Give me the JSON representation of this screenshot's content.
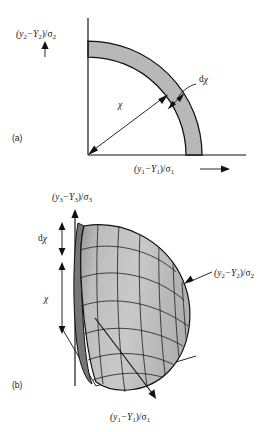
{
  "figure": {
    "background_color": "#ffffff",
    "ink_color": "#111111",
    "shade_color": "#b8b8b8",
    "shade_dark_color": "#8a8a8a",
    "shade_light_color": "#cfcfcf"
  },
  "panel_a": {
    "id": "(a)",
    "yaxis_label": {
      "base1": "(y",
      "sub1": "2",
      "mid": "−Y",
      "sub2": "2",
      "tail": ")/σ",
      "sub3": "2",
      "full": "(y2−Y2)/σ2"
    },
    "xaxis_label": {
      "base1": "(y",
      "sub1": "1",
      "mid": "−Y",
      "sub2": "1",
      "tail": ")/σ",
      "sub3": "1",
      "full": "(y1−Y1)/σ1",
      "arrow": "⟶"
    },
    "radius_label": "χ",
    "thickness_label_prefix": "d",
    "thickness_label_symbol": "χ",
    "shape": "quarter annulus (shell of radius chi and thickness d-chi)"
  },
  "panel_b": {
    "id": "(b)",
    "zaxis_label": {
      "base1": "(y",
      "sub1": "3",
      "mid": "−Y",
      "sub2": "3",
      "tail": ")/σ",
      "sub3": "3",
      "full": "(y3−Y3)/σ3"
    },
    "yaxis_label": {
      "base1": "(y",
      "sub1": "2",
      "mid": "−Y",
      "sub2": "2",
      "tail": ")/σ",
      "sub3": "2",
      "full": "(y2−Y2)/σ2"
    },
    "xaxis_label": {
      "base1": "(y",
      "sub1": "1",
      "mid": "−Y",
      "sub2": "1",
      "tail": ")/σ",
      "sub3": "1",
      "full": "(y1−Y1)/σ1"
    },
    "radius_label": "χ",
    "thickness_label_prefix": "d",
    "thickness_label_symbol": "χ",
    "shape": "octant of spherical shell with quadrilateral mesh"
  }
}
